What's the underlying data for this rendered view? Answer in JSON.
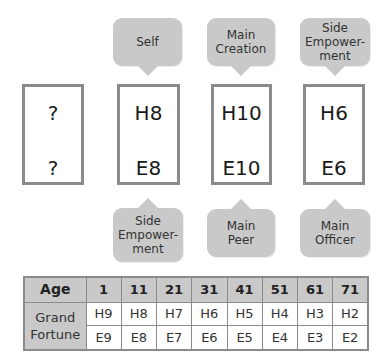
{
  "pillars": [
    {
      "heaven": "?",
      "earth": "?",
      "top_label": null,
      "bottom_label": null
    },
    {
      "heaven": "H8",
      "earth": "E8",
      "top_label": "Self",
      "bottom_label": "Side\nEmpower-\nment"
    },
    {
      "heaven": "H10",
      "earth": "E10",
      "top_label": "Main\nCreation",
      "bottom_label": "Main\nPeer"
    },
    {
      "heaven": "H6",
      "earth": "E6",
      "top_label": "Side\nEmpower-\nment",
      "bottom_label": "Main\nOfficer"
    }
  ],
  "table": {
    "header_label": "Age",
    "row_label": "Grand\nFortune",
    "ages": [
      "1",
      "11",
      "21",
      "31",
      "41",
      "51",
      "61",
      "71"
    ],
    "heaven_stems": [
      "H9",
      "H8",
      "H7",
      "H6",
      "H5",
      "H4",
      "H3",
      "H2"
    ],
    "earth_branches": [
      "E9",
      "E8",
      "E7",
      "E6",
      "E5",
      "E4",
      "E3",
      "E2"
    ]
  },
  "colors": {
    "bubble": "#c9c9c9",
    "border": "#8a8a8a",
    "header_fill": "#c9c9c9"
  }
}
